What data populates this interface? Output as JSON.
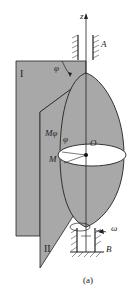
{
  "diagram": {
    "type": "mechanics-figure",
    "caption": "(a)",
    "labels": {
      "axis": "z",
      "bearing_top": "A",
      "bearing_bottom": "B",
      "plane_1": "I",
      "plane_2": "II",
      "angle": "φ",
      "angle_small": "φ",
      "point_m_phi": "Mφ",
      "point_m": "M",
      "center": "O",
      "angular_velocity": "ω"
    },
    "colors": {
      "shade": "#a8a8a8",
      "line": "#222222",
      "background": "#ffffff",
      "ellipse_fill": "#ffffff"
    }
  }
}
